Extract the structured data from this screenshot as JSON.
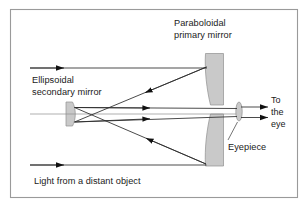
{
  "figure": {
    "background_color": "#ffffff",
    "frame_color": "#9a9a9a",
    "mirror_fill_color": "#c9c9c9",
    "ray_color": "#2b2b2b",
    "axis_color": "#8d8d8d",
    "text_color": "#1a1a1a"
  },
  "labels": {
    "primary_mirror_line1": "Paraboloidal",
    "primary_mirror_line2": "primary mirror",
    "secondary_mirror_line1": "Ellipsoidal",
    "secondary_mirror_line2": "secondary mirror",
    "eye_line1": "To",
    "eye_line2": "the",
    "eye_line3": "eye",
    "eyepiece": "Eyepiece",
    "caption": "Light from a distant object"
  },
  "components": [
    {
      "name": "paraboloidal-primary-mirror-upper",
      "kind": "concave-mirror-segment"
    },
    {
      "name": "paraboloidal-primary-mirror-lower",
      "kind": "concave-mirror-segment"
    },
    {
      "name": "ellipsoidal-secondary-mirror",
      "kind": "concave-mirror"
    },
    {
      "name": "eyepiece-lens",
      "kind": "biconvex-lens"
    }
  ],
  "rays": [
    {
      "name": "incoming-ray-upper",
      "direction": "rightward",
      "arrow": true
    },
    {
      "name": "incoming-ray-lower",
      "direction": "rightward",
      "arrow": true
    },
    {
      "name": "primary-to-secondary-upper",
      "direction": "down-left",
      "arrow": true
    },
    {
      "name": "primary-to-secondary-lower",
      "direction": "up-left",
      "arrow": true
    },
    {
      "name": "secondary-to-eyepiece-upper",
      "direction": "rightward",
      "arrow": true
    },
    {
      "name": "secondary-to-eyepiece-lower",
      "direction": "rightward",
      "arrow": true
    },
    {
      "name": "exit-ray-upper",
      "direction": "rightward",
      "arrow": true
    },
    {
      "name": "exit-ray-lower",
      "direction": "rightward",
      "arrow": true
    },
    {
      "name": "optical-axis",
      "direction": "rightward",
      "arrow": false
    }
  ]
}
